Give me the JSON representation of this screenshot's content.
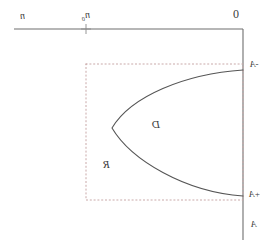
{
  "figure": {
    "background_color": "#ffffff",
    "line_color": "#6e6e6e",
    "curve_color": "#555555",
    "dotted_color": "#c9a9a9",
    "text_color": "#3b3b3b",
    "width": 270,
    "height": 244
  },
  "labels": {
    "axis_left": "n",
    "axis_tick": "n",
    "axis_tick_sub": "0",
    "origin": "0",
    "right_top": "A",
    "right_top_sub": "-",
    "right_mid": "A",
    "right_mid_sub": "+",
    "right_bottom": "A",
    "region_curve": "D",
    "region_rect": "R"
  },
  "geometry": {
    "axis_y": 29,
    "axis_x_start": 14,
    "axis_x_end": 243,
    "vertical_x": 243,
    "vertical_y_start": 29,
    "vertical_y_end": 240,
    "tick_x": 86,
    "rect_left": 86,
    "rect_right": 243,
    "rect_top": 64,
    "rect_bottom": 200,
    "curve_vertex_x": 112,
    "curve_vertex_y": 128,
    "curve_top_x": 243,
    "curve_top_y": 70,
    "curve_bottom_x": 243,
    "curve_bottom_y": 196
  }
}
